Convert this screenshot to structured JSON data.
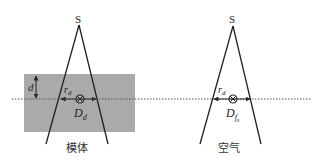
{
  "diagram": {
    "panels": [
      {
        "id": "phantom",
        "source_label": "S",
        "radius_label": "r",
        "radius_sub": "d",
        "dose_label": "D",
        "dose_sub": "d",
        "depth_label": "d",
        "caption": "模体",
        "medium_fill": "#aaaaaa"
      },
      {
        "id": "air",
        "source_label": "S",
        "radius_label": "r",
        "radius_sub": "d",
        "dose_label": "D",
        "dose_sub": "f",
        "dose_subsub": "s",
        "caption": "空气"
      }
    ],
    "colors": {
      "line": "#222222",
      "dotted_axis": "#555555",
      "phantom_fill": "#aaaaaa"
    }
  }
}
